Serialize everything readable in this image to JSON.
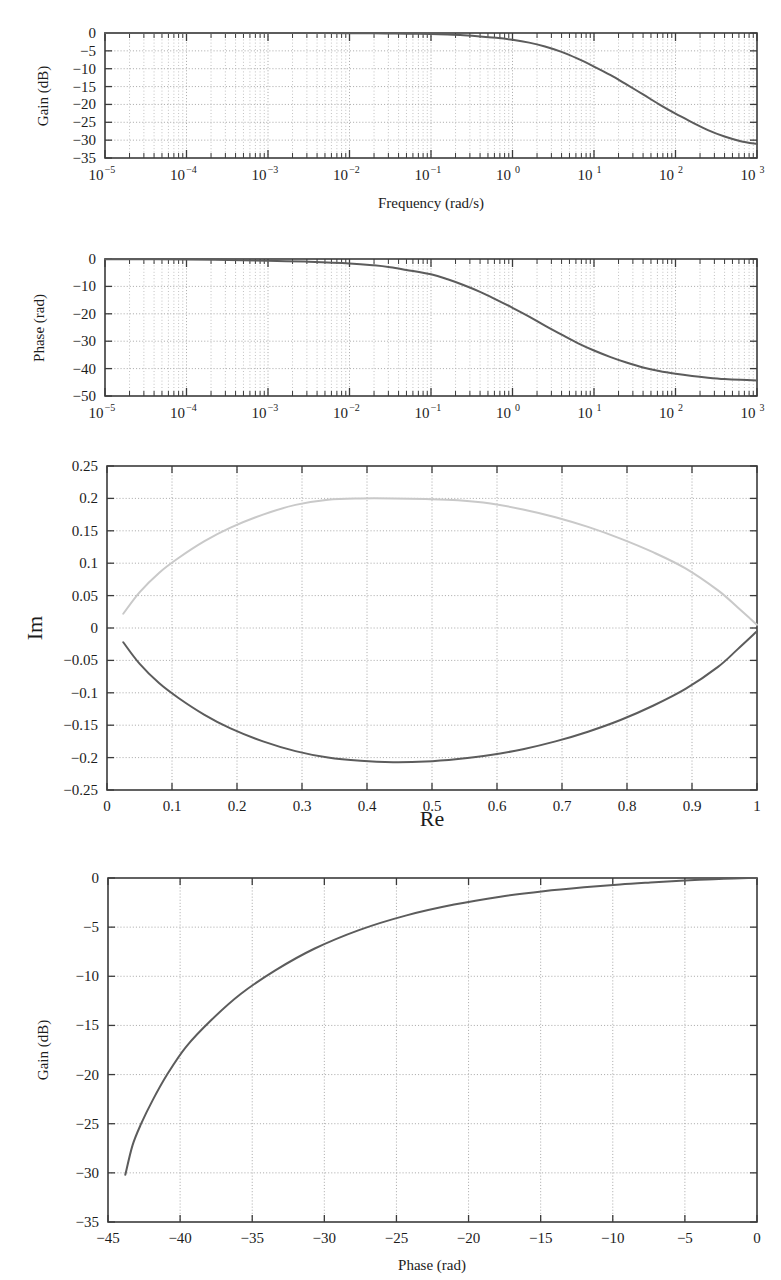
{
  "figure": {
    "background": "#ffffff",
    "curve_color": "#5c5c5c",
    "mirror_curve_color": "#c9c9c9",
    "grid_color": "#9a9a9a",
    "axis_color": "#3b3b3b"
  },
  "chart_data": [
    {
      "type": "line",
      "name": "bode-magnitude",
      "title": "",
      "xlabel": "Frequency (rad/s)",
      "ylabel": "Gain (dB)",
      "xscale": "log",
      "xlim": [
        1e-05,
        1000
      ],
      "ylim": [
        -35,
        0
      ],
      "grid": true,
      "legend": "none",
      "xticklabels": [
        "10−5",
        "10−4",
        "10−3",
        "10−2",
        "10−1",
        "10⁰",
        "10¹",
        "10²",
        "10³"
      ],
      "xtickmantissa": [
        "10",
        "10",
        "10",
        "10",
        "10",
        "10",
        "10",
        "10",
        "10"
      ],
      "xtickexponents": [
        "−5",
        "−4",
        "−3",
        "−2",
        "−1",
        "0",
        "1",
        "2",
        "3"
      ],
      "xtickvalues": [
        1e-05,
        0.0001,
        0.001,
        0.01,
        0.1,
        1,
        10,
        100,
        1000
      ],
      "yticklabels": [
        "0",
        "−5",
        "−10",
        "−15",
        "−20",
        "−25",
        "−30",
        "−35"
      ],
      "ytickvalues": [
        0,
        -5,
        -10,
        -15,
        -20,
        -25,
        -30,
        -35
      ],
      "series": [
        {
          "name": "gain",
          "x": [
            1e-05,
            3.16e-05,
            0.0001,
            0.000316,
            0.001,
            0.00316,
            0.01,
            0.02,
            0.0316,
            0.05,
            0.1,
            0.16,
            0.25,
            0.4,
            0.63,
            1.0,
            1.6,
            2.5,
            4.0,
            6.3,
            10,
            16,
            25,
            40,
            63,
            100,
            160,
            250,
            400,
            630,
            1000
          ],
          "y": [
            0.0,
            0.0,
            0.0,
            0.0,
            -0.01,
            -0.02,
            -0.05,
            -0.08,
            -0.12,
            -0.18,
            -0.3,
            -0.45,
            -0.65,
            -0.95,
            -1.35,
            -1.9,
            -2.7,
            -3.8,
            -5.3,
            -7.2,
            -9.4,
            -11.8,
            -14.4,
            -17.2,
            -20.0,
            -22.6,
            -25.0,
            -27.2,
            -29.0,
            -30.3,
            -31.1
          ]
        }
      ]
    },
    {
      "type": "line",
      "name": "bode-phase",
      "title": "",
      "xlabel": "",
      "ylabel": "Phase (rad)",
      "xscale": "log",
      "xlim": [
        1e-05,
        1000
      ],
      "ylim": [
        -50,
        0
      ],
      "grid": true,
      "legend": "none",
      "xticklabels": [
        "10−5",
        "10−4",
        "10−3",
        "10−2",
        "10−1",
        "10⁰",
        "10¹",
        "10²",
        "10³"
      ],
      "xtickmantissa": [
        "10",
        "10",
        "10",
        "10",
        "10",
        "10",
        "10",
        "10",
        "10"
      ],
      "xtickexponents": [
        "−5",
        "−4",
        "−3",
        "−2",
        "−1",
        "0",
        "1",
        "2",
        "3"
      ],
      "xtickvalues": [
        1e-05,
        0.0001,
        0.001,
        0.01,
        0.1,
        1,
        10,
        100,
        1000
      ],
      "yticklabels": [
        "0",
        "−10",
        "−20",
        "−30",
        "−40",
        "−50"
      ],
      "ytickvalues": [
        0,
        -10,
        -20,
        -30,
        -40,
        -50
      ],
      "series": [
        {
          "name": "phase",
          "x": [
            1e-05,
            0.0001,
            0.001,
            0.00316,
            0.01,
            0.02,
            0.0316,
            0.05,
            0.1,
            0.16,
            0.25,
            0.4,
            0.63,
            1.0,
            1.6,
            2.5,
            4.0,
            6.3,
            10,
            16,
            25,
            40,
            63,
            100,
            160,
            250,
            400,
            630,
            1000
          ],
          "y": [
            -0.05,
            -0.2,
            -0.6,
            -1.0,
            -1.6,
            -2.3,
            -3.0,
            -4.0,
            -5.6,
            -7.4,
            -9.5,
            -12.0,
            -14.8,
            -17.8,
            -21.0,
            -24.3,
            -27.6,
            -30.7,
            -33.4,
            -35.8,
            -37.8,
            -39.6,
            -40.9,
            -41.9,
            -42.7,
            -43.3,
            -43.8,
            -44.1,
            -44.3
          ]
        }
      ]
    },
    {
      "type": "line",
      "name": "nyquist",
      "title": "",
      "xlabel": "Re",
      "ylabel": "Im",
      "xscale": "linear",
      "xlim": [
        0,
        1
      ],
      "ylim": [
        -0.25,
        0.25
      ],
      "grid": true,
      "legend": "none",
      "xticklabels": [
        "0",
        "0.1",
        "0.2",
        "0.3",
        "0.4",
        "0.5",
        "0.6",
        "0.7",
        "0.8",
        "0.9",
        "1"
      ],
      "xtickvalues": [
        0,
        0.1,
        0.2,
        0.3,
        0.4,
        0.5,
        0.6,
        0.7,
        0.8,
        0.9,
        1.0
      ],
      "yticklabels": [
        "0.25",
        "0.2",
        "0.15",
        "0.1",
        "0.05",
        "0",
        "−0.05",
        "−0.1",
        "−0.15",
        "−0.2",
        "−0.25"
      ],
      "ytickvalues": [
        0.25,
        0.2,
        0.15,
        0.1,
        0.05,
        0,
        -0.05,
        -0.1,
        -0.15,
        -0.2,
        -0.25
      ],
      "series": [
        {
          "name": "nyquist-lower",
          "style": "main",
          "x": [
            0.025,
            0.05,
            0.08,
            0.11,
            0.15,
            0.19,
            0.24,
            0.29,
            0.34,
            0.39,
            0.44,
            0.49,
            0.54,
            0.59,
            0.64,
            0.69,
            0.74,
            0.79,
            0.84,
            0.89,
            0.94,
            0.97,
            1.0
          ],
          "y": [
            -0.022,
            -0.055,
            -0.085,
            -0.108,
            -0.134,
            -0.155,
            -0.175,
            -0.19,
            -0.2,
            -0.205,
            -0.207,
            -0.206,
            -0.202,
            -0.196,
            -0.187,
            -0.175,
            -0.16,
            -0.142,
            -0.12,
            -0.094,
            -0.06,
            -0.033,
            -0.005
          ]
        },
        {
          "name": "nyquist-upper-mirror",
          "style": "mirror",
          "x": [
            0.025,
            0.05,
            0.08,
            0.11,
            0.15,
            0.19,
            0.24,
            0.29,
            0.34,
            0.39,
            0.44,
            0.49,
            0.54,
            0.59,
            0.64,
            0.69,
            0.74,
            0.79,
            0.84,
            0.89,
            0.94,
            0.97,
            1.0
          ],
          "y": [
            0.022,
            0.055,
            0.085,
            0.108,
            0.134,
            0.155,
            0.175,
            0.19,
            0.198,
            0.2,
            0.2,
            0.199,
            0.197,
            0.192,
            0.183,
            0.171,
            0.156,
            0.138,
            0.117,
            0.092,
            0.058,
            0.032,
            0.005
          ]
        }
      ]
    },
    {
      "type": "line",
      "name": "nichols",
      "title": "",
      "xlabel": "Phase (rad)",
      "ylabel": "Gain (dB)",
      "xscale": "linear",
      "xlim": [
        -45,
        0
      ],
      "ylim": [
        -35,
        0
      ],
      "grid": true,
      "legend": "none",
      "xticklabels": [
        "−45",
        "−40",
        "−35",
        "−30",
        "−25",
        "−20",
        "−15",
        "−10",
        "−5",
        "0"
      ],
      "xtickvalues": [
        -45,
        -40,
        -35,
        -30,
        -25,
        -20,
        -15,
        -10,
        -5,
        0
      ],
      "yticklabels": [
        "0",
        "−5",
        "−10",
        "−15",
        "−20",
        "−25",
        "−30",
        "−35"
      ],
      "ytickvalues": [
        0,
        -5,
        -10,
        -15,
        -20,
        -25,
        -30,
        -35
      ],
      "series": [
        {
          "name": "nichols-locus",
          "x": [
            -0.05,
            -0.6,
            -1.6,
            -3.0,
            -4.0,
            -5.6,
            -7.4,
            -9.5,
            -12.0,
            -14.8,
            -17.8,
            -21.0,
            -24.3,
            -27.6,
            -30.7,
            -33.4,
            -35.8,
            -37.8,
            -39.6,
            -40.9,
            -41.9,
            -42.7,
            -43.3,
            -43.8
          ],
          "y": [
            0.0,
            -0.01,
            -0.05,
            -0.12,
            -0.18,
            -0.3,
            -0.45,
            -0.65,
            -0.95,
            -1.35,
            -1.9,
            -2.7,
            -3.8,
            -5.3,
            -7.2,
            -9.4,
            -11.8,
            -14.4,
            -17.2,
            -20.0,
            -22.6,
            -25.0,
            -27.2,
            -30.2
          ]
        }
      ]
    }
  ]
}
